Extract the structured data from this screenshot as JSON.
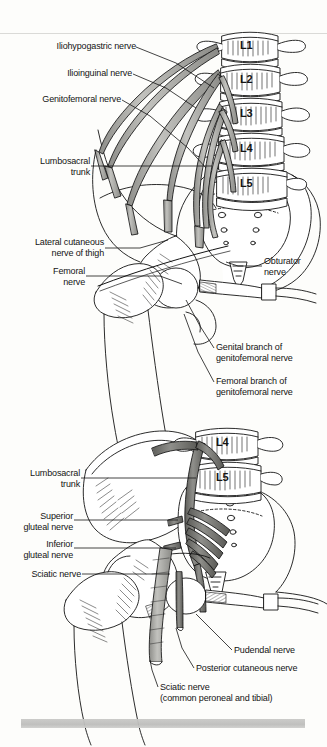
{
  "figure": {
    "background_color": "#fdfdfb",
    "ink_color": "#141414",
    "nerve_fill_light": "#9a9a96",
    "nerve_fill_dark": "#6f6f6b",
    "bone_fill": "#ffffff"
  },
  "upper_diagram": {
    "name": "lumbar-plexus",
    "vertebrae": [
      {
        "label": "L1"
      },
      {
        "label": "L2"
      },
      {
        "label": "L3"
      },
      {
        "label": "L4"
      },
      {
        "label": "L5"
      }
    ],
    "labels_left": [
      {
        "text": "Iliohypogastric nerve"
      },
      {
        "text": "Ilioinguinal nerve"
      },
      {
        "text": "Genitofemoral nerve"
      },
      {
        "text": "Lumbosacral\ntrunk"
      },
      {
        "text": "Lateral cutaneous\nnerve of thigh"
      },
      {
        "text": "Femoral\nnerve"
      }
    ],
    "labels_right": [
      {
        "text": "Obturator\nnerve"
      },
      {
        "text": "Genital branch of\ngenitofemoral nerve"
      },
      {
        "text": "Femoral branch of\ngenitofemoral nerve"
      }
    ]
  },
  "lower_diagram": {
    "name": "sacral-plexus",
    "vertebrae": [
      {
        "label": "L4"
      },
      {
        "label": "L5"
      }
    ],
    "labels_left": [
      {
        "text": "Lumbosacral\ntrunk"
      },
      {
        "text": "Superior\ngluteal nerve"
      },
      {
        "text": "Inferior\ngluteal nerve"
      },
      {
        "text": "Sciatic nerve"
      }
    ],
    "labels_right": [
      {
        "text": "Pudendal nerve"
      },
      {
        "text": "Posterior cutaneous nerve"
      },
      {
        "text": "Sciatic nerve\n(common peroneal and tibial)"
      }
    ]
  }
}
